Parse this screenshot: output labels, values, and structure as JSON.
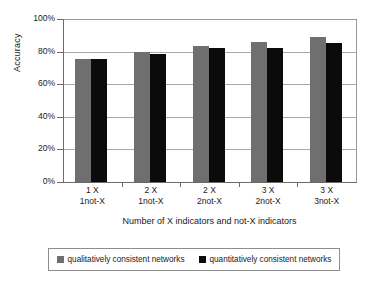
{
  "chart_data": {
    "type": "bar",
    "title": "",
    "xlabel": "Number of X indicators and not-X indicators",
    "ylabel": "Accuracy",
    "ylim": [
      0,
      100
    ],
    "yticks": [
      "0%",
      "20%",
      "40%",
      "60%",
      "80%",
      "100%"
    ],
    "ytick_values": [
      0,
      20,
      40,
      60,
      80,
      100
    ],
    "grid": true,
    "legend_position": "bottom",
    "categories": [
      "1 X\n1not-X",
      "2 X\n1not-X",
      "2 X\n2not-X",
      "3 X\n2not-X",
      "3 X\n3not-X"
    ],
    "category_lines": [
      {
        "line1": "1 X",
        "line2": "1not-X"
      },
      {
        "line1": "2 X",
        "line2": "1not-X"
      },
      {
        "line1": "2 X",
        "line2": "2not-X"
      },
      {
        "line1": "3 X",
        "line2": "2not-X"
      },
      {
        "line1": "3 X",
        "line2": "3not-X"
      }
    ],
    "series": [
      {
        "name": "qualitatively consistent networks",
        "color": "#6f6f6f",
        "values": [
          75.5,
          80,
          83.5,
          86,
          89
        ]
      },
      {
        "name": "quantitatively consistent networks",
        "color": "#0b0b0b",
        "values": [
          75.5,
          78.5,
          82,
          82,
          85
        ]
      }
    ]
  },
  "legend": {
    "entries": [
      {
        "label": "qualitatively consistent networks",
        "color": "#6f6f6f"
      },
      {
        "label": "quantitatively consistent networks",
        "color": "#0b0b0b"
      }
    ]
  },
  "colors": {
    "qualitative_bar": "#6f6f6f",
    "quantitative_bar": "#0b0b0b",
    "axis": "#6b6b6b",
    "gridline": "#a9a9a9",
    "background": "#ffffff"
  }
}
